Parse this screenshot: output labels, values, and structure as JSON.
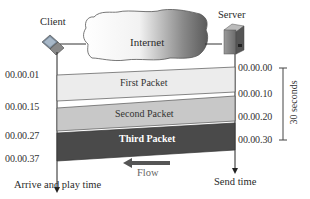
{
  "diagram": {
    "nodes": {
      "client": {
        "label": "Client",
        "icon": "laptop-icon"
      },
      "server": {
        "label": "Server",
        "icon": "server-tower-icon"
      },
      "network": {
        "label": "Internet",
        "icon": "cloud-icon"
      }
    },
    "packets": [
      {
        "label": "First Packet",
        "fill": "#ececec",
        "text_color": "#333333"
      },
      {
        "label": "Second Packet",
        "fill": "#c8c8c8",
        "text_color": "#333333"
      },
      {
        "label": "Third Packet",
        "fill": "#4a4a4a",
        "text_color": "#ffffff"
      }
    ],
    "client_times": [
      "00.00.01",
      "00.00.15",
      "00.00.27",
      "00.00.37"
    ],
    "server_times": [
      "00.00.00",
      "00.00.10",
      "00.00.20",
      "00.00.30"
    ],
    "interval_label": "30 seconds",
    "flow_label": "Flow",
    "client_axis_label": "Arrive and play time",
    "server_axis_label": "Send time"
  }
}
